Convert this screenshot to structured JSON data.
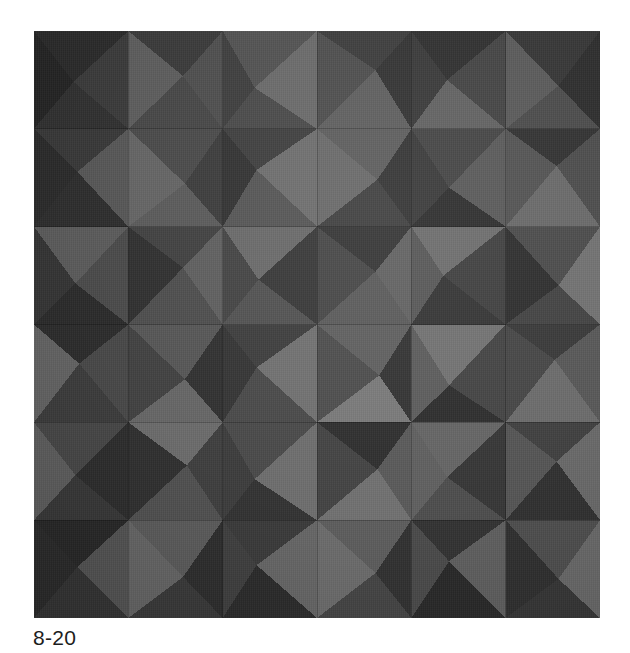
{
  "figure": {
    "caption": "8-20",
    "alt_name": "faceted-panel-photograph",
    "background_color": "#ffffff",
    "caption_color": "#1d1d1d"
  },
  "photo": {
    "x": 34,
    "y": 31,
    "width": 566,
    "height": 587,
    "base_color": "#3b3b3b",
    "grid": {
      "columns": 6,
      "rows": 6,
      "tile_width": 94.333,
      "tile_height": 97.833
    },
    "palette": {
      "darkest": "#232323",
      "very_dark": "#2c2c2c",
      "dark": "#353535",
      "mid_dark": "#3f3f3f",
      "mid": "#4a4a4a",
      "mid_light": "#565656",
      "light": "#646464",
      "lighter": "#6f6f6f",
      "lightest": "#7c7c7c"
    },
    "facet_note": "each tile is split into four triangles meeting at an off-centre apex, each triangle shaded by its angle to the light",
    "tiles": [
      {
        "r": 0,
        "c": 0,
        "ax": 0.42,
        "ay": 0.52,
        "top": "#2a2a2a",
        "right": "#3a3a3a",
        "bottom": "#303030",
        "left": "#242424"
      },
      {
        "r": 0,
        "c": 1,
        "ax": 0.58,
        "ay": 0.46,
        "top": "#3a3a3a",
        "right": "#4e4e4e",
        "bottom": "#474747",
        "left": "#5c5c5c"
      },
      {
        "r": 0,
        "c": 2,
        "ax": 0.34,
        "ay": 0.58,
        "top": "#525252",
        "right": "#6a6a6a",
        "bottom": "#4a4a4a",
        "left": "#3e3e3e"
      },
      {
        "r": 0,
        "c": 3,
        "ax": 0.62,
        "ay": 0.4,
        "top": "#3d3d3d",
        "right": "#343434",
        "bottom": "#5f5f5f",
        "left": "#4e4e4e"
      },
      {
        "r": 0,
        "c": 4,
        "ax": 0.38,
        "ay": 0.5,
        "top": "#303030",
        "right": "#454545",
        "bottom": "#626262",
        "left": "#3a3a3a"
      },
      {
        "r": 0,
        "c": 5,
        "ax": 0.56,
        "ay": 0.56,
        "top": "#373737",
        "right": "#2e2e2e",
        "bottom": "#4c4c4c",
        "left": "#5a5a5a"
      },
      {
        "r": 1,
        "c": 0,
        "ax": 0.46,
        "ay": 0.44,
        "top": "#383838",
        "right": "#565656",
        "bottom": "#2d2d2d",
        "left": "#2a2a2a"
      },
      {
        "r": 1,
        "c": 1,
        "ax": 0.6,
        "ay": 0.56,
        "top": "#4a4a4a",
        "right": "#3c3c3c",
        "bottom": "#5a5a5a",
        "left": "#646464"
      },
      {
        "r": 1,
        "c": 2,
        "ax": 0.36,
        "ay": 0.42,
        "top": "#3f3f3f",
        "right": "#6e6e6e",
        "bottom": "#565656",
        "left": "#333333"
      },
      {
        "r": 1,
        "c": 3,
        "ax": 0.64,
        "ay": 0.52,
        "top": "#5e5e5e",
        "right": "#363636",
        "bottom": "#414141",
        "left": "#6a6a6a"
      },
      {
        "r": 1,
        "c": 4,
        "ax": 0.4,
        "ay": 0.6,
        "top": "#464646",
        "right": "#5a5a5a",
        "bottom": "#2f2f2f",
        "left": "#3b3b3b"
      },
      {
        "r": 1,
        "c": 5,
        "ax": 0.54,
        "ay": 0.38,
        "top": "#333333",
        "right": "#4d4d4d",
        "bottom": "#6a6a6a",
        "left": "#545454"
      },
      {
        "r": 2,
        "c": 0,
        "ax": 0.44,
        "ay": 0.58,
        "top": "#5a5a5a",
        "right": "#4a4a4a",
        "bottom": "#2b2b2b",
        "left": "#343434"
      },
      {
        "r": 2,
        "c": 1,
        "ax": 0.58,
        "ay": 0.42,
        "top": "#414141",
        "right": "#5f5f5f",
        "bottom": "#4e4e4e",
        "left": "#303030"
      },
      {
        "r": 2,
        "c": 2,
        "ax": 0.38,
        "ay": 0.54,
        "top": "#6a6a6a",
        "right": "#393939",
        "bottom": "#525252",
        "left": "#454545"
      },
      {
        "r": 2,
        "c": 3,
        "ax": 0.62,
        "ay": 0.46,
        "top": "#373737",
        "right": "#636363",
        "bottom": "#5c5c5c",
        "left": "#484848"
      },
      {
        "r": 2,
        "c": 4,
        "ax": 0.34,
        "ay": 0.5,
        "top": "#6e6e6e",
        "right": "#414141",
        "bottom": "#363636",
        "left": "#585858"
      },
      {
        "r": 2,
        "c": 5,
        "ax": 0.56,
        "ay": 0.6,
        "top": "#4c4c4c",
        "right": "#727272",
        "bottom": "#444444",
        "left": "#2f2f2f"
      },
      {
        "r": 3,
        "c": 0,
        "ax": 0.48,
        "ay": 0.4,
        "top": "#2c2c2c",
        "right": "#484848",
        "bottom": "#3c3c3c",
        "left": "#636363"
      },
      {
        "r": 3,
        "c": 1,
        "ax": 0.6,
        "ay": 0.56,
        "top": "#565656",
        "right": "#313131",
        "bottom": "#666666",
        "left": "#424242"
      },
      {
        "r": 3,
        "c": 2,
        "ax": 0.36,
        "ay": 0.44,
        "top": "#3e3e3e",
        "right": "#717171",
        "bottom": "#4a4a4a",
        "left": "#353535"
      },
      {
        "r": 3,
        "c": 3,
        "ax": 0.66,
        "ay": 0.52,
        "top": "#606060",
        "right": "#343434",
        "bottom": "#7a7a7a",
        "left": "#4e4e4e"
      },
      {
        "r": 3,
        "c": 4,
        "ax": 0.4,
        "ay": 0.62,
        "top": "#737373",
        "right": "#454545",
        "bottom": "#2e2e2e",
        "left": "#5d5d5d"
      },
      {
        "r": 3,
        "c": 5,
        "ax": 0.52,
        "ay": 0.36,
        "top": "#3a3a3a",
        "right": "#585858",
        "bottom": "#6c6c6c",
        "left": "#474747"
      },
      {
        "r": 4,
        "c": 0,
        "ax": 0.44,
        "ay": 0.54,
        "top": "#474747",
        "right": "#2d2d2d",
        "bottom": "#383838",
        "left": "#5e5e5e"
      },
      {
        "r": 4,
        "c": 1,
        "ax": 0.62,
        "ay": 0.44,
        "top": "#6b6b6b",
        "right": "#3f3f3f",
        "bottom": "#515151",
        "left": "#303030"
      },
      {
        "r": 4,
        "c": 2,
        "ax": 0.34,
        "ay": 0.58,
        "top": "#4a4a4a",
        "right": "#6e6e6e",
        "bottom": "#333333",
        "left": "#3d3d3d"
      },
      {
        "r": 4,
        "c": 3,
        "ax": 0.64,
        "ay": 0.48,
        "top": "#2f2f2f",
        "right": "#5a5a5a",
        "bottom": "#717171",
        "left": "#444444"
      },
      {
        "r": 4,
        "c": 4,
        "ax": 0.38,
        "ay": 0.56,
        "top": "#656565",
        "right": "#373737",
        "bottom": "#4e4e4e",
        "left": "#606060"
      },
      {
        "r": 4,
        "c": 5,
        "ax": 0.54,
        "ay": 0.4,
        "top": "#414141",
        "right": "#696969",
        "bottom": "#313131",
        "left": "#555555"
      },
      {
        "r": 5,
        "c": 0,
        "ax": 0.46,
        "ay": 0.48,
        "top": "#282828",
        "right": "#545454",
        "bottom": "#343434",
        "left": "#2b2b2b"
      },
      {
        "r": 5,
        "c": 1,
        "ax": 0.58,
        "ay": 0.58,
        "top": "#5c5c5c",
        "right": "#2e2e2e",
        "bottom": "#3a3a3a",
        "left": "#666666"
      },
      {
        "r": 5,
        "c": 2,
        "ax": 0.36,
        "ay": 0.46,
        "top": "#3b3b3b",
        "right": "#676767",
        "bottom": "#2c2c2c",
        "left": "#404040"
      },
      {
        "r": 5,
        "c": 3,
        "ax": 0.62,
        "ay": 0.54,
        "top": "#5e5e5e",
        "right": "#323232",
        "bottom": "#464646",
        "left": "#6d6d6d"
      },
      {
        "r": 5,
        "c": 4,
        "ax": 0.4,
        "ay": 0.42,
        "top": "#333333",
        "right": "#606060",
        "bottom": "#2a2a2a",
        "left": "#4b4b4b"
      },
      {
        "r": 5,
        "c": 5,
        "ax": 0.56,
        "ay": 0.6,
        "top": "#4f4f4f",
        "right": "#6a6a6a",
        "bottom": "#373737",
        "left": "#303030"
      }
    ]
  }
}
